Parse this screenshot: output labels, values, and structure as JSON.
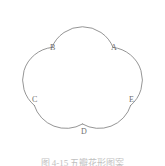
{
  "figure": {
    "name": "five-petal-flower-outline",
    "shape_type": "cinquefoil",
    "petal_count": 5,
    "stroke_color": "#7a7a7a",
    "fill_color": "#ffffff",
    "background_color": "#ffffff",
    "stroke_width": "0.8",
    "labels": [
      {
        "id": "A",
        "text": "A",
        "x": 111,
        "y": 44
      },
      {
        "id": "B",
        "text": "B",
        "x": 50,
        "y": 44
      },
      {
        "id": "C",
        "text": "C",
        "x": 32,
        "y": 96
      },
      {
        "id": "D",
        "text": "D",
        "x": 81,
        "y": 128
      },
      {
        "id": "E",
        "text": "E",
        "x": 129,
        "y": 96
      }
    ],
    "outline_path": "M 83 3 C 100 3 113 16 113 31 C 113 31 114 38 120 39 C 126 39 131 36 136 33 C 149 25 165 30 170 44 C 175 58 168 73 154 78 C 149 80 146 85 147 91 C 149 97 153 101 157 105 C 168 115 168 131 158 142 C 148 152 132 151 123 140 C 119 136 115 132 109 132 C 103 133 99 138 96 143 C 89 156 73 160 61 152 C 49 144 46 128 54 116 C 57 111 60 107 59 101 C 57 95 52 92 46 90 C 32 86 25 71 30 57 C 35 43 51 38 64 46 C 69 49 74 52 80 51 C 86 50 90 45 92 39 C 92 39 93 31 93 31"
  },
  "caption": {
    "visible_fragment": "图 4-15  五瓣花形图案",
    "clipped": true
  },
  "colors": {
    "stroke": "#7a7a7a",
    "label_text": "#6e6e6e",
    "caption_text": "#8c8c8c",
    "background": "#ffffff"
  }
}
